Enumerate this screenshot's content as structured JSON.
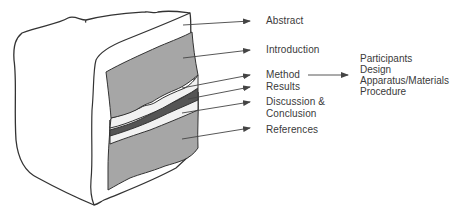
{
  "diagram": {
    "colors": {
      "outline": "#333333",
      "frosting": "#ffffff",
      "cake_light_gray": "#a6a6a6",
      "filling_white": "#f2f2f2",
      "filling_dark": "#555555",
      "arrow": "#444444",
      "text": "#3a3a3a"
    },
    "labels": [
      {
        "id": "abstract",
        "text": "Abstract"
      },
      {
        "id": "introduction",
        "text": "Introduction"
      },
      {
        "id": "method",
        "text": "Method"
      },
      {
        "id": "results",
        "text": "Results"
      },
      {
        "id": "discussion_1",
        "text": "Discussion &"
      },
      {
        "id": "discussion_2",
        "text": "Conclusion"
      },
      {
        "id": "references",
        "text": "References"
      }
    ],
    "method_subsections": [
      "Participants",
      "Design",
      "Apparatus/Materials",
      "Procedure"
    ]
  }
}
